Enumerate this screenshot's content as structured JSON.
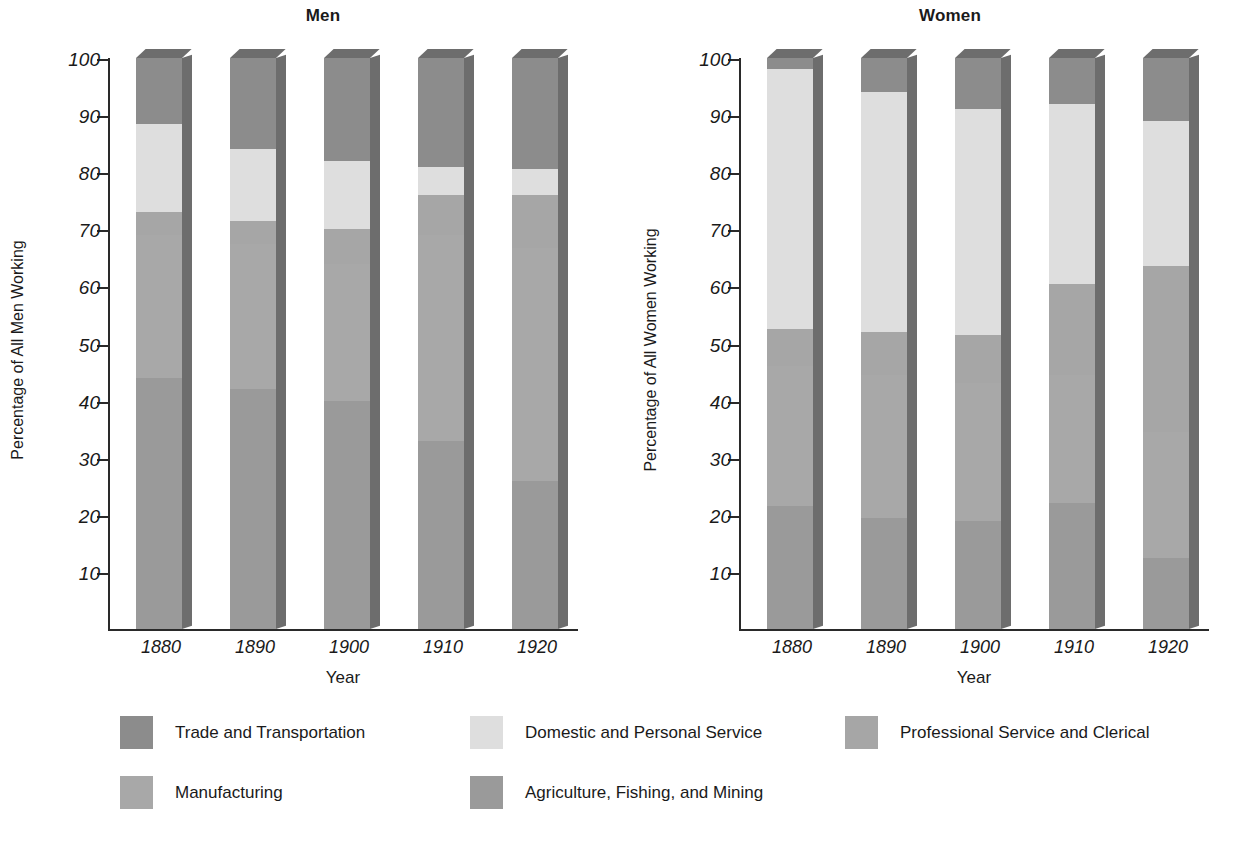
{
  "chart_data": {
    "type": "bar",
    "subtype": "stacked-bar-3d",
    "panels": [
      {
        "title": "Men",
        "ylabel": "Percentage of All Men Working",
        "xlabel": "Year",
        "categories": [
          "1880",
          "1890",
          "1900",
          "1910",
          "1920"
        ],
        "ylim": [
          0,
          100
        ],
        "yticks": [
          10,
          20,
          30,
          40,
          50,
          60,
          70,
          80,
          90,
          100
        ],
        "series": [
          {
            "name": "Agriculture, Fishing, and Mining",
            "values": [
              44.0,
              42.0,
              40.0,
              33.0,
              26.0
            ]
          },
          {
            "name": "Manufacturing",
            "values": [
              25.0,
              25.5,
              24.0,
              36.0,
              40.7
            ]
          },
          {
            "name": "Professional Service and Clerical",
            "values": [
              4.0,
              4.0,
              6.0,
              7.0,
              9.3
            ]
          },
          {
            "name": "Domestic and Personal Service",
            "values": [
              15.5,
              12.5,
              12.0,
              5.0,
              4.5
            ]
          },
          {
            "name": "Trade and Transportation",
            "values": [
              11.5,
              16.0,
              18.0,
              19.0,
              19.5
            ]
          }
        ]
      },
      {
        "title": "Women",
        "ylabel": "Percentage of All Women Working",
        "xlabel": "Year",
        "categories": [
          "1880",
          "1890",
          "1900",
          "1910",
          "1920"
        ],
        "ylim": [
          0,
          100
        ],
        "yticks": [
          10,
          20,
          30,
          40,
          50,
          60,
          70,
          80,
          90,
          100
        ],
        "series": [
          {
            "name": "Agriculture, Fishing, and Mining",
            "values": [
              21.5,
              19.5,
              19.0,
              22.0,
              12.5
            ]
          },
          {
            "name": "Manufacturing",
            "values": [
              24.5,
              25.0,
              24.0,
              22.5,
              22.0
            ]
          },
          {
            "name": "Professional Service and Clerical",
            "values": [
              6.5,
              7.5,
              8.5,
              16.0,
              29.0
            ]
          },
          {
            "name": "Domestic and Personal Service",
            "values": [
              45.5,
              42.0,
              39.5,
              31.5,
              25.5
            ]
          },
          {
            "name": "Trade and Transportation",
            "values": [
              2.0,
              6.0,
              9.0,
              8.0,
              11.0
            ]
          }
        ]
      }
    ],
    "legend": {
      "position": "bottom",
      "entries": [
        {
          "label": "Trade and Transportation",
          "color": "#8c8c8c"
        },
        {
          "label": "Domestic and Personal Service",
          "color": "#dedede"
        },
        {
          "label": "Professional Service and Clerical",
          "color": "#a6a6a6"
        },
        {
          "label": "Manufacturing",
          "color": "#a8a8a8"
        },
        {
          "label": "Agriculture, Fishing, and Mining",
          "color": "#9a9a9a"
        }
      ]
    },
    "grid": false,
    "colors": {
      "trade": "#8c8c8c",
      "domestic": "#dedede",
      "professional": "#a6a6a6",
      "manufacturing": "#a8a8a8",
      "agriculture": "#9a9a9a",
      "axis": "#2a2a2a",
      "side_face": "#6d6d6d",
      "background": "#ffffff"
    }
  }
}
